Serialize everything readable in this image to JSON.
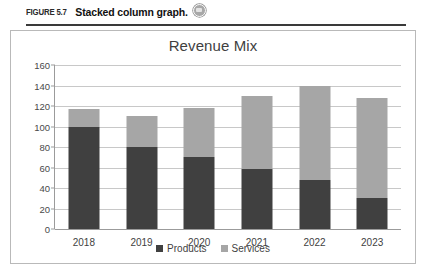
{
  "figure": {
    "number_label": "FIGURE 5.7",
    "caption": "Stacked column graph.",
    "badge_icon": "media-badge-icon"
  },
  "chart_data": {
    "type": "bar",
    "stacked": true,
    "title": "Revenue Mix",
    "xlabel": "",
    "ylabel": "",
    "ylim": [
      0,
      160
    ],
    "ytick_step": 20,
    "yticks": [
      "160",
      "140",
      "120",
      "100",
      "80",
      "60",
      "40",
      "20",
      "0"
    ],
    "grid": true,
    "legend_position": "bottom",
    "categories": [
      "2018",
      "2019",
      "2020",
      "2021",
      "2022",
      "2023"
    ],
    "series": [
      {
        "name": "Products",
        "color": "#404040",
        "values": [
          100,
          80,
          70,
          59,
          48,
          30
        ]
      },
      {
        "name": "Services",
        "color": "#a6a6a6",
        "values": [
          17,
          30,
          48,
          71,
          92,
          98
        ]
      }
    ],
    "totals": [
      117,
      110,
      118,
      130,
      140,
      128
    ]
  }
}
